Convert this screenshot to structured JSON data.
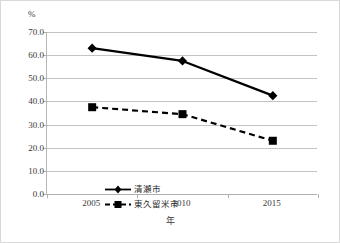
{
  "chart_data": {
    "type": "line",
    "title": "",
    "xlabel": "年",
    "ylabel": "%",
    "y_unit_label": "%",
    "categories": [
      "2005",
      "2010",
      "2015"
    ],
    "x": [
      2005,
      2010,
      2015
    ],
    "ylim": [
      0.0,
      70.0
    ],
    "y_ticks": [
      "0.0",
      "10.0",
      "20.0",
      "30.0",
      "40.0",
      "50.0",
      "60.0",
      "70.0"
    ],
    "y_tick_values": [
      0.0,
      10.0,
      20.0,
      30.0,
      40.0,
      50.0,
      60.0,
      70.0
    ],
    "grid": true,
    "legend_position": "inside-lower-left",
    "series": [
      {
        "name": "清瀬市",
        "values": [
          63.0,
          57.5,
          42.5
        ],
        "line_style": "solid",
        "marker": "diamond",
        "color": "#000000"
      },
      {
        "name": "東久留米市",
        "values": [
          37.5,
          34.5,
          23.0
        ],
        "line_style": "dashed",
        "marker": "square",
        "color": "#000000"
      }
    ]
  },
  "legend": {
    "items": [
      {
        "label": "清瀬市"
      },
      {
        "label": "東久留米市"
      }
    ]
  },
  "axes": {
    "y_unit": "%",
    "x_title": "年"
  },
  "colors": {
    "series_line": "#000000",
    "gridline": "#c4c4c4",
    "axis": "#b0b0b0",
    "text": "#3a3a3a",
    "border": "#d9d9d9",
    "background": "#ffffff"
  }
}
